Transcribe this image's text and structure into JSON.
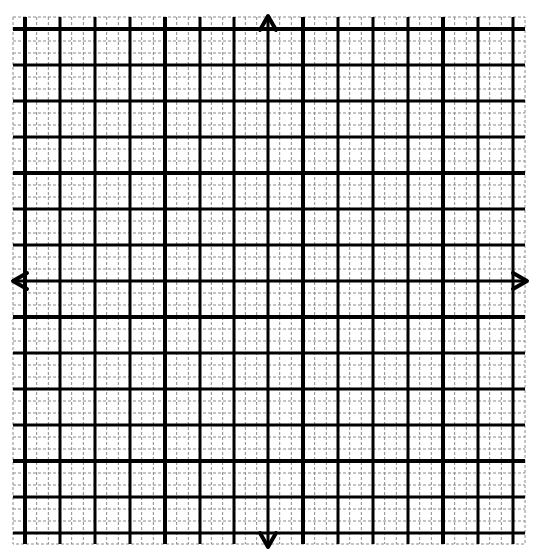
{
  "canvas": {
    "width": 541,
    "height": 557,
    "background": "#ffffff"
  },
  "grid": {
    "bounds": {
      "left": 13,
      "top": 17,
      "right": 525,
      "bottom": 544
    },
    "vertical_lines_x": [
      25,
      60,
      95,
      130,
      165,
      200,
      234,
      268,
      303,
      338,
      373,
      408,
      443,
      478,
      513
    ],
    "horizontal_lines_y": [
      29,
      65,
      101,
      137,
      173,
      209,
      245,
      281,
      317,
      353,
      389,
      425,
      461,
      497,
      533
    ],
    "major_vertical_x": [
      25,
      165,
      303,
      443
    ],
    "major_horizontal_y": [
      29,
      173,
      317,
      461
    ],
    "subdivisions": 3,
    "colors": {
      "line": "#000000",
      "minor": "#8a8a8a"
    },
    "widths": {
      "major": 4,
      "medium": 3,
      "minor": 1
    }
  },
  "axes": {
    "x_axis_y": 281,
    "y_axis_x": 268,
    "arrows": {
      "up": {
        "x": 268,
        "y": 16
      },
      "down": {
        "x": 268,
        "y": 547
      },
      "left": {
        "x": 13,
        "y": 281
      },
      "right": {
        "x": 527,
        "y": 281
      }
    }
  }
}
